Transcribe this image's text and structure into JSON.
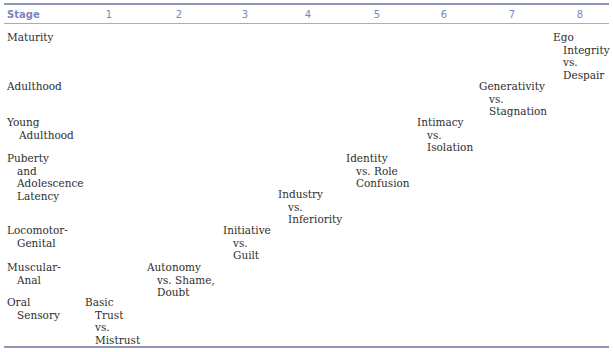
{
  "table": {
    "header": {
      "stage_label": "Stage",
      "columns": [
        "1",
        "2",
        "3",
        "4",
        "5",
        "6",
        "7",
        "8"
      ]
    },
    "rows": [
      {
        "stage": [
          "Maturity"
        ]
      },
      {
        "stage": [
          "Adulthood"
        ]
      },
      {
        "stage": [
          "Young",
          "Adulthood"
        ]
      },
      {
        "stage": [
          "Puberty",
          "and",
          "Adolescence",
          "Latency"
        ]
      },
      {
        "stage": [
          "Locomotor-",
          "Genital"
        ]
      },
      {
        "stage": [
          "Muscular-",
          "Anal"
        ]
      },
      {
        "stage": [
          "Oral",
          "Sensory"
        ]
      }
    ],
    "crises": [
      {
        "column": 8,
        "lines": [
          "Ego",
          "Integrity",
          "vs.",
          "Despair"
        ]
      },
      {
        "column": 7,
        "lines": [
          "Generativity",
          "vs.",
          "Stagnation"
        ]
      },
      {
        "column": 6,
        "lines": [
          "Intimacy",
          "vs.",
          "Isolation"
        ]
      },
      {
        "column": 5,
        "lines": [
          "Identity",
          "vs. Role",
          "Confusion"
        ]
      },
      {
        "column": 4,
        "lines": [
          "Industry",
          "vs.",
          "Inferiority"
        ]
      },
      {
        "column": 3,
        "lines": [
          "Initiative",
          "vs.",
          "Guilt"
        ]
      },
      {
        "column": 2,
        "lines": [
          "Autonomy",
          "vs. Shame,",
          "Doubt"
        ]
      },
      {
        "column": 1,
        "lines": [
          "Basic",
          "Trust",
          "vs.",
          "Mistrust"
        ]
      }
    ]
  },
  "colors": {
    "header_text": "#7b86bd",
    "rule": "#8f97b8",
    "body_text": "#2e2e2e"
  }
}
